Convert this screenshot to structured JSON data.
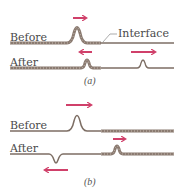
{
  "colors": {
    "rope": "#8a7a70",
    "rope_light": "#c9bdb3",
    "thin": "#7d6e64",
    "arrow": "#d0406a",
    "text": "#4a4a4a"
  },
  "panel_a": {
    "caption": "(a)",
    "before_label": "Before",
    "after_label": "After",
    "interface_label": "Interface",
    "description": "Pulse on heavy (braided) rope travels right toward interface with light rope; reflected pulse upright moving left, transmitted pulse upright moving right"
  },
  "panel_b": {
    "caption": "(b)",
    "before_label": "Before",
    "after_label": "After",
    "description": "Pulse on light rope travels right toward interface with heavy (braided) rope; reflected pulse inverted moving left, transmitted pulse upright moving right"
  }
}
